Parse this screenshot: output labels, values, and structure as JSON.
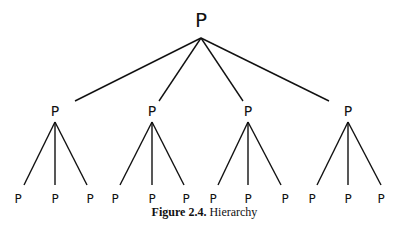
{
  "diagram": {
    "root": {
      "label": "P",
      "x": 201,
      "y": 27,
      "apex": [
        201,
        38
      ]
    },
    "children": [
      {
        "label": "P",
        "x": 55,
        "y": 116,
        "apex": [
          55,
          122
        ],
        "parent_end": [
          75,
          101
        ],
        "leaves": [
          {
            "label": "P",
            "x": 18
          },
          {
            "label": "P",
            "x": 55
          },
          {
            "label": "P",
            "x": 90
          }
        ],
        "leaf_ends": [
          [
            24,
            185
          ],
          [
            55,
            185
          ],
          [
            87,
            185
          ]
        ]
      },
      {
        "label": "P",
        "x": 152,
        "y": 116,
        "apex": [
          152,
          122
        ],
        "parent_end": [
          159,
          101
        ],
        "leaves": [
          {
            "label": "P",
            "x": 115
          },
          {
            "label": "P",
            "x": 152
          },
          {
            "label": "P",
            "x": 186
          }
        ],
        "leaf_ends": [
          [
            120,
            185
          ],
          [
            152,
            185
          ],
          [
            184,
            185
          ]
        ]
      },
      {
        "label": "P",
        "x": 248,
        "y": 116,
        "apex": [
          248,
          122
        ],
        "parent_end": [
          243,
          101
        ],
        "leaves": [
          {
            "label": "P",
            "x": 213
          },
          {
            "label": "P",
            "x": 248
          },
          {
            "label": "P",
            "x": 285
          }
        ],
        "leaf_ends": [
          [
            218,
            185
          ],
          [
            248,
            185
          ],
          [
            281,
            185
          ]
        ]
      },
      {
        "label": "P",
        "x": 348,
        "y": 116,
        "apex": [
          348,
          122
        ],
        "parent_end": [
          329,
          101
        ],
        "leaves": [
          {
            "label": "P",
            "x": 312
          },
          {
            "label": "P",
            "x": 348
          },
          {
            "label": "P",
            "x": 381
          }
        ],
        "leaf_ends": [
          [
            317,
            185
          ],
          [
            348,
            185
          ],
          [
            381,
            185
          ]
        ]
      }
    ],
    "leaf_y": 203
  },
  "caption": {
    "label": "Figure 2.4.",
    "text": "Hierarchy"
  }
}
